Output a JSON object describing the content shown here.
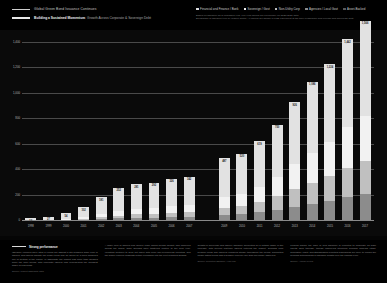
{
  "header": {
    "line1": "Global Green Bond Issuance Continues",
    "line2_bold": "Building a Sustained Momentum",
    "line2_rest": "Growth Across Corporate & Sovereign Debt",
    "legend": [
      {
        "label": "Financial and Finance / Bank",
        "color": "#e2e2e2"
      },
      {
        "label": "Sovereign / Govt",
        "color": "#f2f2f2"
      },
      {
        "label": "Non-Utility Corp",
        "color": "#c0c0c0"
      },
      {
        "label": "Agencies / Local Govt",
        "color": "#8c8c8c"
      },
      {
        "label": "Asset-Backed",
        "color": "#5a5a5a"
      }
    ],
    "note1": "Based on issuance as of published year. Full-year figures are preliminary for 2020/2021 data.",
    "note2": "Breakdown of issuance type by market sector. All figures are shown in USD equivalent at the time of issuance and exclude sub-sovereign debt."
  },
  "chart_data": {
    "type": "bar",
    "title": "Global Green Bond Issuance Continues",
    "xlabel": "",
    "ylabel": "USD bn",
    "ylim": [
      0,
      1400
    ],
    "grid": true,
    "stacked": true,
    "legend_position": "top-right",
    "categories": [
      "1998",
      "1999",
      "2000",
      "2001",
      "2002",
      "2003",
      "2004",
      "2005",
      "2006",
      "2007",
      "",
      "2009",
      "2010",
      "2011",
      "2012",
      "2013",
      "2014",
      "2015",
      "2016",
      "2017"
    ],
    "series": [
      {
        "name": "Financial and Finance / Bank",
        "color": "#e2e2e2",
        "values": [
          12,
          27,
          48,
          82,
          133,
          178,
          191,
          196,
          216,
          220,
          null,
          305,
          314,
          357,
          412,
          486,
          560,
          612,
          694,
          748
        ]
      },
      {
        "name": "Sovereign / Govt",
        "color": "#f2f2f2",
        "values": [
          0,
          0,
          6,
          14,
          28,
          40,
          46,
          48,
          52,
          56,
          null,
          84,
          92,
          118,
          152,
          196,
          232,
          268,
          318,
          352
        ]
      },
      {
        "name": "Non-Utility Corp",
        "color": "#c0c0c0",
        "values": [
          0,
          0,
          0,
          6,
          14,
          22,
          28,
          30,
          36,
          40,
          null,
          58,
          66,
          82,
          104,
          140,
          168,
          196,
          232,
          264
        ]
      },
      {
        "name": "Agencies / Local Govt",
        "color": "#8c8c8c",
        "values": [
          0,
          0,
          0,
          0,
          6,
          12,
          16,
          18,
          22,
          26,
          null,
          40,
          48,
          62,
          82,
          104,
          126,
          148,
          178,
          202
        ]
      },
      {
        "name": "Asset-Backed",
        "color": "#5a5a5a",
        "values": [
          0,
          0,
          0,
          0,
          0,
          0,
          0,
          0,
          0,
          0,
          null,
          0,
          0,
          0,
          0,
          0,
          0,
          0,
          0,
          0
        ]
      }
    ],
    "totals": [
      12,
      27,
      54,
      102,
      181,
      252,
      281,
      292,
      326,
      342,
      null,
      487,
      520,
      619,
      750,
      926,
      1086,
      1224,
      1442,
      1566
    ],
    "bar_labels": [
      "12",
      "27",
      "54",
      "102",
      "181",
      "252",
      "281",
      "292",
      "326",
      "342",
      "",
      "487",
      "520",
      "619",
      "750",
      "926",
      "1,086",
      "1,224",
      "1,442",
      "1,566"
    ],
    "y_ticks": [
      "1,400",
      "1,200",
      "1,000",
      "800",
      "600",
      "400",
      "200",
      "0"
    ],
    "y_tick_values": [
      1400,
      1200,
      1000,
      800,
      600,
      400,
      200,
      0
    ]
  },
  "footer": {
    "columns": [
      {
        "heading": "Strong performance",
        "body": "Issuance volumes have lifted a record set against a still subdued wider pool of issuers, and figures indicate the longer trend may be driven by a more balanced mix of sectors in the region. In aggregate the market has more than doubled since the prior period, with corporate issuers now representing the broadest share of new deals.",
        "source": "Source: Market aggregate data"
      },
      {
        "heading": "",
        "body": "A wider pool of issuers and deeper order books means liquidity has improved across the board, while spreads have tightened relative to the prior year. Investors continue to seek out paper with clear use-of-proceeds reporting, and the supply pipeline suggests further expansion into the next reporting window.",
        "source": ""
      },
      {
        "heading": "",
        "body": "Growth in sovereign and agency issuance accounted for a notable share of the increase, with several first-time issuers entering the market. Demand from pension funds and insurers remained steady throughout the period, supporting longer-dated tenors and a broader currency mix than previously observed.",
        "source": "Source: Reported issuance, year-end"
      },
      {
        "heading": "",
        "body": "Looking ahead, the pace of new issuance is expected to moderate as base effects work through, though underlying structural demand appears intact. Regulatory clarity and standardised reporting frameworks are likely to remain the principal determinants of issuance growth over the coming cycle.",
        "source": "Source: Annual review"
      }
    ],
    "page": ""
  }
}
